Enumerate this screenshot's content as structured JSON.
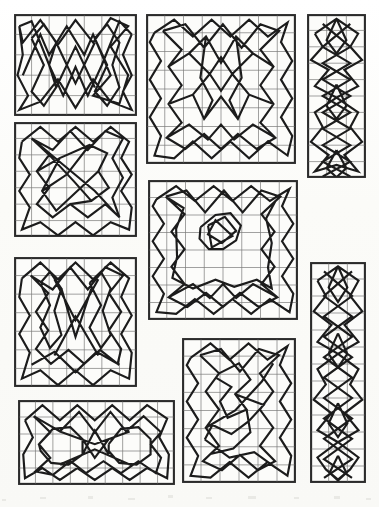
{
  "plate": {
    "title": "Geometric Knot Pattern Plate",
    "description": "Scanned book plate showing nine rectangular panels, each containing a ruled square grid overlaid with a continuous angular interlace / knotwork polyline drawn in heavy black ink.",
    "background_color": "#fdfdfb",
    "grid_color": "#7a7a78",
    "frame_color": "#2b2b2b",
    "ink_color": "#1c1c1c",
    "panel_count": 9,
    "caption": ""
  },
  "panels": [
    {
      "id": "panel-1",
      "name": "top-left-wide",
      "x": 14,
      "y": 14,
      "width": 123,
      "height": 102,
      "cols": 7,
      "rows": 5,
      "cell_w": 17.57,
      "cell_h": 20.4,
      "motif": "twin-lobed symmetric interlace",
      "path": "M 0.50 3.00 L 1.50 1.00 L 2.00 2.00 L 3.00 0.60 L 4.00 2.00 L 4.50 1.00 L 5.50 3.00 L 4.50 4.00 L 6.00 4.40 L 6.50 3.00 L 5.50 1.60 L 6.50 0.60 L 5.50 0.20 L 4.50 1.40 L 3.50 0.30 L 2.50 1.50 L 1.50 0.30 L 0.50 1.40 L 0.30 0.60 M 0.30 0.60 L 0.50 2.00 L 0.20 3.00 L 0.80 4.00 L 0.30 4.70 L 1.50 4.30 L 2.50 3.20 L 3.50 4.60 L 4.50 3.20 L 5.50 4.30 L 6.70 4.70 L 6.20 3.80 L 6.70 3.00 L 6.20 2.00 L 6.70 1.00 M 6.70 1.00 L 6.00 0.35 L 5.00 2.50 L 4.20 4.00 L 3.50 2.60 L 2.80 4.00 L 2.00 2.50 L 1.00 0.35 L 0.30 0.60 M 1.00 1.20 L 1.70 2.50 L 1.00 3.80 L 1.70 4.50 L 2.40 3.60 L 2.00 2.50 L 2.40 1.40 L 1.70 0.50 L 1.00 1.20 M 4.60 1.20 L 5.30 2.50 L 4.60 3.80 L 5.30 4.50 L 6.00 3.60 L 5.60 2.50 L 6.00 1.40 L 5.30 0.50 L 4.60 1.20 M 2.40 1.40 L 3.50 3.40 L 4.60 1.40 M 2.40 3.60 L 3.50 1.60 L 4.60 3.60"
    },
    {
      "id": "panel-2",
      "name": "top-center-large",
      "x": 146,
      "y": 14,
      "width": 150,
      "height": 150,
      "cols": 8,
      "rows": 8,
      "cell_w": 18.75,
      "cell_h": 18.75,
      "motif": "square border interlace with central star cluster",
      "path": "M 0.45 1.00 L 1.50 0.30 L 2.50 1.20 L 3.50 0.30 L 4.50 1.20 L 5.50 0.30 L 6.50 1.20 L 7.55 0.45 L 7.20 1.50 L 7.80 2.50 L 7.20 3.50 L 7.80 4.50 L 7.20 5.50 L 7.80 6.50 L 7.55 7.55 L 6.50 6.80 L 5.50 7.70 L 4.50 6.80 L 3.50 7.70 L 2.50 6.80 L 1.50 7.70 L 0.45 7.55 L 0.80 6.50 L 0.20 5.50 L 0.80 4.50 L 0.20 3.50 L 0.80 2.50 L 0.20 1.50 L 0.45 1.00 M 0.90 0.90 L 1.90 1.90 L 1.20 2.80 L 1.90 3.80 L 1.20 4.80 L 1.90 5.80 L 1.10 6.60 L 2.10 7.20 L 3.10 6.40 L 4.00 7.20 L 4.90 6.40 L 5.90 7.20 L 6.90 6.60 L 6.10 5.80 L 6.80 4.80 L 6.10 3.80 L 6.80 2.80 L 6.10 1.90 L 7.10 0.90 L 6.10 0.55 L 5.10 1.80 L 4.10 0.55 L 3.10 1.80 L 2.10 0.55 L 0.90 0.90 M 1.20 2.80 L 2.30 2.10 L 3.40 3.20 L 2.50 4.30 L 1.20 4.80 M 6.80 2.80 L 5.70 2.10 L 4.60 3.20 L 5.50 4.30 L 6.80 4.80 M 2.30 2.10 L 3.20 1.20 L 4.00 2.60 L 4.80 1.20 L 5.70 2.10 M 2.50 4.30 L 3.10 5.60 L 4.00 4.40 L 4.90 5.60 L 5.50 4.30 M 3.20 1.20 L 2.90 3.40 L 3.55 4.60 L 3.10 5.60 M 4.80 1.20 L 5.10 3.40 L 4.45 4.60 L 4.90 5.60 M 3.40 3.20 L 4.00 2.30 L 4.60 3.20 L 4.00 4.10 L 3.40 3.20 M 1.10 6.60 L 2.30 5.90 L 3.30 6.70 L 4.00 5.90 L 4.70 6.70 L 5.70 5.90 L 6.90 6.60"
    },
    {
      "id": "panel-3",
      "name": "top-right-tall-narrow",
      "x": 307,
      "y": 14,
      "width": 59,
      "height": 164,
      "cols": 3,
      "rows": 10,
      "cell_w": 19.67,
      "cell_h": 16.4,
      "motif": "vertical chain of star knots",
      "path": "M 0.40 1.20 L 1.50 0.30 L 2.60 1.20 L 2.20 2.00 L 2.80 2.80 L 1.90 3.40 L 2.60 4.40 L 1.50 5.10 L 2.60 6.00 L 2.20 6.90 L 2.80 7.80 L 1.90 8.60 L 2.60 9.60 L 1.50 9.20 L 0.40 9.60 L 1.10 8.60 L 0.20 7.80 L 0.80 6.90 L 0.40 6.00 L 1.50 5.10 L 0.40 4.40 L 1.10 3.40 L 0.20 2.80 L 0.80 2.00 L 0.40 1.20 M 0.80 0.60 L 2.20 2.00 L 0.80 3.00 L 2.20 4.00 L 0.80 5.00 L 2.20 6.00 L 0.80 7.00 L 2.20 8.00 L 0.80 9.00 L 2.20 9.90 M 2.20 0.60 L 0.80 2.00 L 2.20 3.00 L 0.80 4.00 L 2.20 5.00 L 0.80 6.00 L 2.20 7.00 L 0.80 8.00 L 2.20 9.00 L 0.80 9.90 M 1.50 0.30 L 1.00 1.60 L 1.50 2.40 L 2.00 1.60 L 1.50 0.30 M 1.50 4.30 L 1.00 5.60 L 1.50 6.40 L 2.00 5.60 L 1.50 4.30 M 1.50 8.30 L 1.00 9.40 L 1.50 9.95 L 2.00 9.40 L 1.50 8.30"
    },
    {
      "id": "panel-4",
      "name": "left-middle-square",
      "x": 14,
      "y": 122,
      "width": 123,
      "height": 115,
      "cols": 7,
      "rows": 7,
      "cell_w": 17.57,
      "cell_h": 16.43,
      "motif": "rotated square interlace with diagonal sweep",
      "path": "M 0.45 1.20 L 1.50 0.30 L 2.50 1.20 L 3.50 0.30 L 4.50 1.20 L 5.50 0.30 L 6.55 1.20 L 6.10 2.20 L 6.70 3.20 L 6.10 4.20 L 6.70 5.20 L 6.55 6.55 L 5.50 6.10 L 4.50 6.90 L 3.50 6.10 L 2.50 6.90 L 1.50 6.10 L 0.45 6.55 L 0.90 5.20 L 0.30 4.20 L 0.90 3.20 L 0.30 2.20 L 0.45 1.20 M 1.00 1.00 L 2.00 2.00 L 1.30 3.00 L 2.00 4.00 L 1.30 5.00 L 2.20 5.80 L 3.20 5.00 L 4.20 5.80 L 5.20 5.00 L 6.00 5.80 L 5.60 4.60 L 6.20 3.40 L 5.60 2.20 L 6.20 1.00 L 5.20 0.55 L 4.20 1.70 L 3.20 0.55 L 2.20 1.70 L 1.00 1.00 M 1.30 3.00 L 2.60 2.20 L 4.30 1.40 L 5.30 1.90 L 4.80 3.00 L 5.40 4.00 L 4.40 4.80 L 3.20 5.00 M 2.60 2.20 L 1.60 4.20 L 2.40 5.40 L 3.60 4.20 L 4.80 3.00 M 1.00 1.00 L 2.80 2.60 L 4.60 4.20 L 5.90 5.70 M 1.60 4.20 L 3.00 3.20 L 4.30 1.40 M 2.00 2.00 L 3.40 3.60 L 4.40 4.80"
    },
    {
      "id": "panel-5",
      "name": "center-middle-large",
      "x": 148,
      "y": 180,
      "width": 150,
      "height": 140,
      "cols": 8,
      "rows": 8,
      "cell_w": 18.75,
      "cell_h": 17.5,
      "motif": "wide border interlace with small central star",
      "path": "M 0.45 1.10 L 1.50 0.35 L 2.50 1.20 L 3.50 0.35 L 4.50 1.20 L 5.50 0.35 L 6.50 1.20 L 7.55 0.50 L 7.15 1.50 L 7.75 2.50 L 7.15 3.50 L 7.75 4.50 L 7.15 5.50 L 7.75 6.50 L 7.55 7.55 L 6.50 6.80 L 5.50 7.65 L 4.50 6.80 L 3.50 7.65 L 2.50 6.80 L 1.50 7.65 L 0.45 7.55 L 0.85 6.50 L 0.25 5.50 L 0.85 4.50 L 0.25 3.50 L 0.85 2.50 L 0.25 1.50 L 0.45 1.10 M 0.95 0.95 L 1.95 1.95 L 1.25 2.95 L 1.95 3.95 L 1.25 4.95 L 1.95 5.95 L 1.10 6.70 L 2.10 7.25 L 3.10 6.45 L 4.00 7.25 L 4.90 6.45 L 5.90 7.25 L 6.90 6.70 L 6.05 5.95 L 6.75 4.95 L 6.05 3.95 L 6.75 2.95 L 6.05 1.95 L 7.05 0.95 L 6.05 0.60 L 5.05 1.85 L 4.05 0.60 L 3.05 1.85 L 2.05 0.60 L 0.95 0.95 M 0.95 0.95 L 1.90 1.60 L 1.50 2.80 L 1.55 4.40 L 1.30 5.60 L 2.40 6.20 L 3.60 5.70 L 4.60 6.10 L 5.80 5.70 L 6.60 6.20 L 6.40 5.00 L 6.60 3.60 L 6.30 2.20 L 6.80 1.20 M 3.20 2.60 L 4.10 2.10 L 4.70 2.90 L 3.95 3.60 L 3.20 3.10 L 3.60 2.30 L 4.50 3.20 L 3.40 3.85 L 3.20 2.60 M 2.80 2.70 L 3.60 2.00 L 4.40 1.90 L 4.95 2.60 L 4.70 3.45 L 4.00 3.95 L 3.25 3.95 L 2.75 3.35 L 2.80 2.70 M 1.10 6.70 L 2.40 5.95 L 3.30 6.75 L 4.00 5.95 L 4.70 6.75 L 5.60 5.95 L 6.90 6.70"
    },
    {
      "id": "panel-6",
      "name": "left-lower-square",
      "x": 14,
      "y": 257,
      "width": 123,
      "height": 130,
      "cols": 7,
      "rows": 7,
      "cell_w": 17.57,
      "cell_h": 18.57,
      "motif": "twin vertical lobes with crossing X centre",
      "path": "M 0.45 1.15 L 1.50 0.30 L 2.50 1.20 L 3.50 0.30 L 4.50 1.20 L 5.50 0.30 L 6.55 1.15 L 6.10 2.15 L 6.70 3.15 L 6.10 4.15 L 6.70 5.15 L 6.55 6.55 L 5.50 6.10 L 4.50 6.90 L 3.50 6.10 L 2.50 6.90 L 1.50 6.10 L 0.45 6.55 L 0.90 5.15 L 0.30 4.15 L 0.90 3.15 L 0.30 2.15 L 0.45 1.15 M 0.95 1.00 L 1.95 1.95 L 1.25 2.95 L 1.95 3.95 L 1.25 4.95 L 2.10 5.75 L 3.10 5.00 L 4.00 5.75 L 4.90 5.00 L 5.90 5.75 L 6.10 4.95 L 5.40 3.95 L 6.10 2.95 L 5.40 1.95 L 6.20 1.00 L 5.20 0.55 L 4.20 1.75 L 3.20 0.55 L 2.20 1.75 L 0.95 1.00 M 1.50 1.40 L 2.05 2.60 L 1.50 3.80 L 2.05 4.90 L 2.70 4.20 L 2.30 2.90 L 2.70 1.70 L 2.05 0.80 L 1.50 1.40 M 4.30 1.40 L 4.95 2.60 L 4.30 3.80 L 4.95 4.90 L 5.50 4.20 L 5.05 2.90 L 5.50 1.70 L 4.95 0.80 L 4.30 1.40 M 2.30 1.20 L 3.50 3.40 L 4.80 1.20 M 2.30 5.30 L 3.50 3.20 L 4.80 5.30 M 2.70 1.70 L 3.50 4.30 L 4.40 1.70 M 1.00 5.80 L 2.30 5.10 L 3.50 6.20 L 4.70 5.10 L 6.00 5.80"
    },
    {
      "id": "panel-7",
      "name": "right-tall-narrow",
      "x": 310,
      "y": 262,
      "width": 56,
      "height": 221,
      "cols": 3,
      "rows": 13,
      "cell_w": 18.67,
      "cell_h": 17.0,
      "motif": "long vertical chain of star knots",
      "path": "M 0.40 1.10 L 1.50 0.25 L 2.60 1.10 L 2.15 2.00 L 2.80 2.90 L 1.85 3.70 L 2.60 4.70 L 1.50 5.40 L 2.60 6.30 L 2.15 7.20 L 2.80 8.10 L 1.85 8.90 L 2.60 9.90 L 1.50 10.60 L 2.60 11.50 L 2.15 12.20 L 1.50 12.80 L 0.85 12.20 L 0.40 11.50 L 1.50 10.60 L 0.40 9.90 L 1.15 8.90 L 0.20 8.10 L 0.85 7.20 L 0.40 6.30 L 1.50 5.40 L 0.40 4.70 L 1.15 3.70 L 0.20 2.90 L 0.85 2.00 L 0.40 1.10 M 0.75 0.55 L 2.25 2.00 L 0.75 3.20 L 2.25 4.40 L 0.75 5.60 L 2.25 6.80 L 0.75 8.00 L 2.25 9.20 L 0.75 10.40 L 2.25 11.60 L 0.75 12.70 M 2.25 0.55 L 0.75 2.00 L 2.25 3.20 L 0.75 4.40 L 2.25 5.60 L 0.75 6.80 L 2.25 8.00 L 0.75 9.20 L 2.25 10.40 L 0.75 11.60 L 2.25 12.70 M 1.50 0.25 L 1.00 1.50 L 1.50 2.35 L 2.00 1.50 L 1.50 0.25 M 1.50 4.20 L 1.00 5.40 L 1.50 6.20 L 2.00 5.40 L 1.50 4.20 M 1.50 8.30 L 1.00 9.50 L 1.50 10.30 L 2.00 9.50 L 1.50 8.30 M 1.50 11.40 L 1.05 12.40 L 1.50 12.85 L 1.95 12.40 L 1.50 11.40"
    },
    {
      "id": "panel-8",
      "name": "bottom-center-upright",
      "x": 182,
      "y": 338,
      "width": 114,
      "height": 145,
      "cols": 6,
      "rows": 8,
      "cell_w": 19.0,
      "cell_h": 18.13,
      "motif": "upright rectangle interlace with irregular inner meander",
      "path": "M 0.45 1.10 L 1.50 0.30 L 2.50 1.20 L 3.50 0.30 L 4.50 1.20 L 5.55 0.45 L 5.15 1.50 L 5.75 2.50 L 5.15 3.50 L 5.75 4.50 L 5.15 5.50 L 5.75 6.50 L 5.55 7.60 L 4.50 6.85 L 3.50 7.70 L 2.50 6.85 L 1.50 7.70 L 0.45 7.60 L 0.85 6.50 L 0.25 5.50 L 0.85 4.50 L 0.25 3.50 L 0.85 2.50 L 0.25 1.50 L 0.45 1.10 M 0.95 0.95 L 1.95 1.95 L 1.25 2.95 L 1.95 3.95 L 1.25 4.95 L 1.95 5.95 L 1.10 6.80 L 2.10 7.30 L 3.05 6.45 L 4.00 7.30 L 4.90 6.80 L 4.10 5.95 L 4.80 4.95 L 4.10 3.95 L 4.80 2.95 L 4.10 1.95 L 5.10 0.95 L 4.05 0.60 L 3.05 1.85 L 2.05 0.60 L 0.95 0.95 M 1.95 1.95 L 3.00 1.40 L 3.60 2.30 L 2.80 3.10 L 3.40 3.95 L 2.40 4.40 L 2.00 3.50 L 2.60 2.70 L 1.80 2.20 M 2.80 3.10 L 4.30 3.70 L 3.50 4.60 L 2.60 5.30 L 1.60 4.80 L 1.20 5.60 M 3.40 3.95 L 3.60 5.20 L 2.70 6.10 L 1.50 6.40 L 1.10 6.80 M 1.25 4.95 L 2.80 4.00 L 4.20 2.40 L 4.80 1.40 M 1.20 5.60 L 2.50 6.60 L 3.80 6.30 L 4.60 6.90"
    },
    {
      "id": "panel-9",
      "name": "bottom-left-wide",
      "x": 18,
      "y": 400,
      "width": 157,
      "height": 85,
      "cols": 9,
      "rows": 5,
      "cell_w": 17.44,
      "cell_h": 17.0,
      "motif": "two circular knot rosettes side by side",
      "path": "M 0.40 1.20 L 1.40 0.30 L 2.40 1.20 L 3.40 0.30 L 4.40 1.20 L 5.40 0.30 L 6.40 1.20 L 7.40 0.30 L 8.55 1.10 L 8.10 2.20 L 8.65 3.20 L 8.55 4.60 L 7.40 4.00 L 6.40 4.70 L 5.40 4.00 L 4.40 4.70 L 3.40 4.00 L 2.40 4.70 L 1.40 4.00 L 0.40 4.60 L 0.30 3.20 L 0.85 2.20 L 0.40 1.20 M 0.90 0.95 L 1.85 1.90 L 1.20 2.60 L 1.85 3.40 L 1.00 4.20 L 2.00 4.40 L 3.00 3.60 L 3.90 4.30 L 4.90 3.60 L 5.90 4.30 L 6.90 3.60 L 7.90 4.30 L 8.20 3.40 L 7.60 2.60 L 8.20 1.90 L 7.20 0.95 L 6.20 1.85 L 5.30 0.70 L 4.40 1.90 L 3.50 0.70 L 2.40 1.85 L 0.90 0.95 M 1.20 2.60 L 2.00 1.70 L 3.00 1.60 L 3.70 2.30 L 3.70 3.20 L 2.90 3.80 L 1.90 3.70 L 1.30 3.00 L 1.20 2.60 M 5.20 2.60 L 5.90 1.70 L 6.90 1.60 L 7.60 2.30 L 7.60 3.20 L 6.80 3.80 L 5.80 3.70 L 5.20 3.00 L 5.20 2.60 M 3.70 2.30 L 4.40 3.40 L 5.20 2.30 M 3.70 3.20 L 4.40 1.80 L 5.20 3.20 M 2.40 1.85 L 4.40 2.60 L 6.40 1.85 M 2.40 3.80 L 4.40 2.90 L 6.40 3.80"
    }
  ],
  "scan_artifacts": {
    "present": true,
    "description": "faint grey smudges along bottom margin of the scanned page",
    "marks": [
      {
        "x": 40,
        "y": 497,
        "width": 6,
        "height": 2
      },
      {
        "x": 88,
        "y": 496,
        "width": 5,
        "height": 3
      },
      {
        "x": 128,
        "y": 498,
        "width": 7,
        "height": 2
      },
      {
        "x": 168,
        "y": 495,
        "width": 5,
        "height": 3
      },
      {
        "x": 206,
        "y": 497,
        "width": 6,
        "height": 2
      },
      {
        "x": 248,
        "y": 496,
        "width": 8,
        "height": 3
      },
      {
        "x": 294,
        "y": 497,
        "width": 5,
        "height": 2
      },
      {
        "x": 334,
        "y": 496,
        "width": 6,
        "height": 3
      },
      {
        "x": 2,
        "y": 499,
        "width": 4,
        "height": 2
      },
      {
        "x": 366,
        "y": 498,
        "width": 5,
        "height": 2
      }
    ]
  }
}
